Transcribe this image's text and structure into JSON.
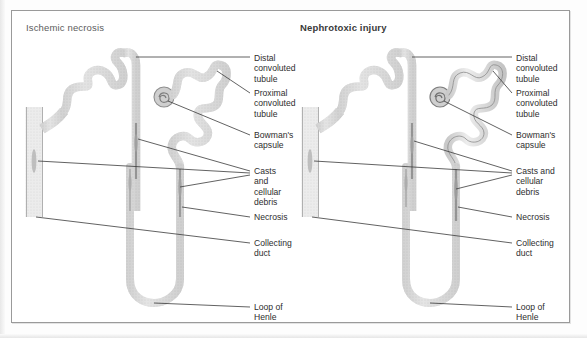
{
  "figure": {
    "panels": [
      {
        "id": "ischemic",
        "title": "Ischemic necrosis",
        "labels": [
          {
            "name": "distal-convoluted-tubule",
            "text": "Distal\nconvoluted\ntubule"
          },
          {
            "name": "proximal-convoluted-tubule",
            "text": "Proximal\nconvoluted\ntubule"
          },
          {
            "name": "bowmans-capsule",
            "text": "Bowman's\ncapsule"
          },
          {
            "name": "casts-and-cellular-debris",
            "text": "Casts and\ncellular\ndebris"
          },
          {
            "name": "necrosis",
            "text": "Necrosis"
          },
          {
            "name": "collecting-duct",
            "text": "Collecting\nduct"
          },
          {
            "name": "loop-of-henle",
            "text": "Loop of\nHenle"
          }
        ]
      },
      {
        "id": "nephrotoxic",
        "title": "Nephrotoxic injury",
        "labels": [
          {
            "name": "distal-convoluted-tubule",
            "text": "Distal\nconvoluted\ntubule"
          },
          {
            "name": "proximal-convoluted-tubule",
            "text": "Proximal\nconvoluted\ntubule"
          },
          {
            "name": "bowmans-capsule",
            "text": "Bowman's\ncapsule"
          },
          {
            "name": "casts-and-cellular-debris",
            "text": "Casts and\ncellular\ndebris"
          },
          {
            "name": "necrosis",
            "text": "Necrosis"
          },
          {
            "name": "collecting-duct",
            "text": "Collecting\nduct"
          },
          {
            "name": "loop-of-henle",
            "text": "Loop of\nHenle"
          }
        ]
      }
    ],
    "colors": {
      "frame_border": "#9a9a9a",
      "tubule_fill": "#d8d8d8",
      "tubule_stroke": "#a8a8a8",
      "tubule_dark_stroke": "#6f6f6f",
      "leader_line": "#3a3a3a",
      "label_text": "#2e2e2e",
      "title_text_left": "#5c5c5c",
      "title_text_right": "#3a3a3a",
      "background": "#ffffff"
    }
  }
}
